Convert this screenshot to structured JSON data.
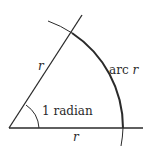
{
  "diagram": {
    "type": "geometry",
    "title": "",
    "colors": {
      "stroke": "#2a2a2a",
      "background": "#ffffff"
    },
    "labels": {
      "ray_length": "r",
      "arc_length": "arc r",
      "angle": "1 radian",
      "base_length": "r"
    }
  }
}
